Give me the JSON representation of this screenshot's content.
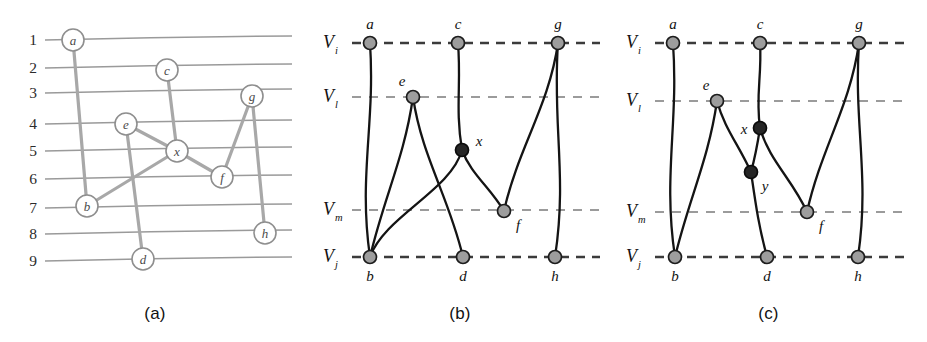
{
  "figure": {
    "panels": [
      {
        "id": "a",
        "caption": "(a)",
        "type": "grid-drawing",
        "row_numbers": [
          "1",
          "2",
          "3",
          "4",
          "5",
          "6",
          "7",
          "8",
          "9"
        ],
        "row_y": [
          39,
          67,
          92,
          123,
          150,
          178,
          207,
          233,
          260
        ],
        "row_label_x": 33,
        "grid_x_start": 45,
        "grid_x_end": 292,
        "grid_slope": -3,
        "nodes": [
          {
            "id": "a",
            "label": "a",
            "x": 73,
            "y": 40,
            "row": 1
          },
          {
            "id": "c",
            "label": "c",
            "x": 167,
            "y": 70,
            "row": 2
          },
          {
            "id": "g",
            "label": "g",
            "x": 252,
            "y": 96,
            "row": 3
          },
          {
            "id": "e",
            "label": "e",
            "x": 126,
            "y": 124,
            "row": 4
          },
          {
            "id": "x",
            "label": "x",
            "x": 177,
            "y": 151,
            "row": 5
          },
          {
            "id": "f",
            "label": "f",
            "x": 222,
            "y": 177,
            "row": 6
          },
          {
            "id": "b",
            "label": "b",
            "x": 87,
            "y": 206,
            "row": 7
          },
          {
            "id": "h",
            "label": "h",
            "x": 265,
            "y": 233,
            "row": 8
          },
          {
            "id": "d",
            "label": "d",
            "x": 143,
            "y": 259,
            "row": 9
          }
        ],
        "node_radius": 11,
        "edges": [
          [
            "a",
            "b"
          ],
          [
            "c",
            "x"
          ],
          [
            "e",
            "x"
          ],
          [
            "e",
            "d"
          ],
          [
            "x",
            "b"
          ],
          [
            "x",
            "f"
          ],
          [
            "f",
            "g"
          ],
          [
            "g",
            "h"
          ]
        ]
      },
      {
        "id": "b",
        "caption": "(b)",
        "type": "layered-drawing",
        "layers": [
          {
            "id": "Vi",
            "main": "V",
            "sub": "i",
            "y": 43,
            "style": "major"
          },
          {
            "id": "Vl",
            "main": "V",
            "sub": "l",
            "y": 97,
            "style": "minor"
          },
          {
            "id": "Vm",
            "main": "V",
            "sub": "m",
            "y": 210,
            "style": "minor"
          },
          {
            "id": "Vj",
            "main": "V",
            "sub": "j",
            "y": 257,
            "style": "major"
          }
        ],
        "layer_label_x": 40,
        "line_x_start": 52,
        "line_x_end": 300,
        "nodes": [
          {
            "id": "a",
            "label": "a",
            "x": 70,
            "y": 43,
            "kind": "real",
            "label_pos": "above"
          },
          {
            "id": "c",
            "label": "c",
            "x": 158,
            "y": 43,
            "kind": "real",
            "label_pos": "above"
          },
          {
            "id": "g",
            "label": "g",
            "x": 258,
            "y": 43,
            "kind": "real",
            "label_pos": "above"
          },
          {
            "id": "e",
            "label": "e",
            "x": 113,
            "y": 97,
            "kind": "real",
            "label_pos": "above-left"
          },
          {
            "id": "x",
            "label": "x",
            "x": 162,
            "y": 150,
            "kind": "dummy",
            "label_pos": "above-right"
          },
          {
            "id": "f",
            "label": "f",
            "x": 204,
            "y": 211,
            "kind": "real",
            "label_pos": "below-right"
          },
          {
            "id": "b",
            "label": "b",
            "x": 70,
            "y": 257,
            "kind": "real",
            "label_pos": "below"
          },
          {
            "id": "d",
            "label": "d",
            "x": 163,
            "y": 257,
            "kind": "real",
            "label_pos": "below"
          },
          {
            "id": "h",
            "label": "h",
            "x": 255,
            "y": 257,
            "kind": "real",
            "label_pos": "below"
          }
        ],
        "node_radius": 6.5,
        "edges": [
          {
            "from": "a",
            "to": "b"
          },
          {
            "from": "c",
            "to": "x"
          },
          {
            "from": "e",
            "to": "d"
          },
          {
            "from": "e",
            "to": "b"
          },
          {
            "from": "x",
            "to": "b"
          },
          {
            "from": "x",
            "to": "f"
          },
          {
            "from": "g",
            "to": "f"
          },
          {
            "from": "g",
            "to": "h"
          }
        ]
      },
      {
        "id": "c",
        "caption": "(c)",
        "type": "layered-drawing",
        "layers": [
          {
            "id": "Vi",
            "main": "V",
            "sub": "i",
            "y": 43,
            "style": "major"
          },
          {
            "id": "Vl",
            "main": "V",
            "sub": "l",
            "y": 101,
            "style": "minor"
          },
          {
            "id": "Vm",
            "main": "V",
            "sub": "m",
            "y": 212,
            "style": "minor"
          },
          {
            "id": "Vj",
            "main": "V",
            "sub": "j",
            "y": 257,
            "style": "major"
          }
        ],
        "layer_label_x": 33,
        "line_x_start": 45,
        "line_x_end": 300,
        "nodes": [
          {
            "id": "a",
            "label": "a",
            "x": 63,
            "y": 43,
            "kind": "real",
            "label_pos": "above"
          },
          {
            "id": "c",
            "label": "c",
            "x": 150,
            "y": 43,
            "kind": "real",
            "label_pos": "above"
          },
          {
            "id": "g",
            "label": "g",
            "x": 249,
            "y": 43,
            "kind": "real",
            "label_pos": "above"
          },
          {
            "id": "e",
            "label": "e",
            "x": 107,
            "y": 101,
            "kind": "real",
            "label_pos": "above-left"
          },
          {
            "id": "x",
            "label": "x",
            "x": 150,
            "y": 128,
            "kind": "dummy",
            "label_pos": "left"
          },
          {
            "id": "y",
            "label": "y",
            "x": 141,
            "y": 172,
            "kind": "dummy",
            "label_pos": "below-right"
          },
          {
            "id": "f",
            "label": "f",
            "x": 197,
            "y": 212,
            "kind": "real",
            "label_pos": "below-right"
          },
          {
            "id": "b",
            "label": "b",
            "x": 65,
            "y": 257,
            "kind": "real",
            "label_pos": "below"
          },
          {
            "id": "d",
            "label": "d",
            "x": 157,
            "y": 257,
            "kind": "real",
            "label_pos": "below"
          },
          {
            "id": "h",
            "label": "h",
            "x": 248,
            "y": 257,
            "kind": "real",
            "label_pos": "below"
          }
        ],
        "node_radius": 6.5,
        "edges": [
          {
            "from": "a",
            "to": "b"
          },
          {
            "from": "c",
            "to": "x"
          },
          {
            "from": "x",
            "to": "y"
          },
          {
            "from": "x",
            "to": "f"
          },
          {
            "from": "e",
            "to": "y"
          },
          {
            "from": "e",
            "to": "b"
          },
          {
            "from": "y",
            "to": "d"
          },
          {
            "from": "g",
            "to": "f"
          },
          {
            "from": "g",
            "to": "h"
          }
        ]
      }
    ],
    "colors": {
      "grid_line": "#9a9a9a",
      "edge_a": "#a8a8a8",
      "edge_bc": "#141414",
      "node_real_fill": "#9d9d9d",
      "node_dummy_fill": "#262626",
      "layer_major": "#3b3b3b",
      "layer_minor": "#9b9b9b",
      "background": "#ffffff"
    }
  }
}
